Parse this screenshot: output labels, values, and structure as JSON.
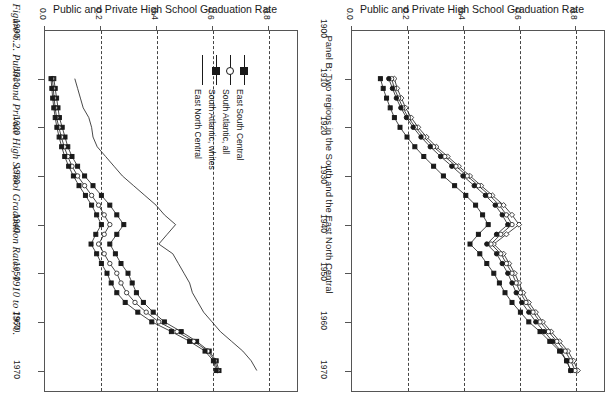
{
  "figure": {
    "caption": "Figure 6.2. Public and Private High School Graduation Rates, 1910 to 1970.",
    "panel_b_caption": "Panel B: Two regions in the South and the East North Central"
  },
  "panels": [
    {
      "id": "panel-left",
      "title": "Public and Private High School Graduation Rate",
      "value_axis": {
        "ticks": [
          "0.0",
          "0.2",
          "0.4",
          "0.6",
          "0.8"
        ],
        "min": 0.0,
        "max": 0.9
      },
      "year_axis": {
        "ticks": [
          "1900",
          "1910",
          "1920",
          "1930",
          "1940",
          "1950",
          "1960",
          "1970"
        ],
        "min": 1900,
        "max": 1974
      },
      "legend": [
        {
          "label": "East North Central",
          "marker": "line"
        },
        {
          "label": "South Atlantic, whites",
          "marker": "filled-square"
        },
        {
          "label": "South Atlantic, all",
          "marker": "open-circle"
        },
        {
          "label": "East South Central",
          "marker": "filled-square"
        }
      ]
    },
    {
      "id": "panel-right",
      "title": "Public and Private High School Graduation Rate",
      "value_axis": {
        "ticks": [
          "0.0",
          "0.2",
          "0.4",
          "0.6",
          "0.8"
        ],
        "min": 0.0,
        "max": 0.9
      },
      "year_axis": {
        "ticks": [
          "1900",
          "1910",
          "1920",
          "1930",
          "1940",
          "1950",
          "1960",
          "1970"
        ],
        "min": 1900,
        "max": 1974
      },
      "legend": [
        {
          "label": "Pacific",
          "marker": "line-dash"
        },
        {
          "label": "New England",
          "marker": "open-circle"
        },
        {
          "label": "West North Central",
          "marker": "filled-square"
        },
        {
          "label": "Middle Atlantic",
          "marker": "filled-square"
        }
      ]
    }
  ],
  "chart_data": [
    {
      "type": "line",
      "panel": "left",
      "title": "Public and Private High School Graduation Rate",
      "subtitle": "Figure 6.2. Public and Private High School Graduation Rates, 1910 to 1970.",
      "xlabel": "Year",
      "ylabel": "Public and Private High School Graduation Rate",
      "orientation": "rotated-90",
      "xlim": [
        1900,
        1974
      ],
      "ylim": [
        0.0,
        0.9
      ],
      "grid": "dashed vertical gridlines at 0.2, 0.4, 0.6, 0.8",
      "legend_position": "upper-right-inside",
      "x": [
        1910,
        1912,
        1914,
        1916,
        1918,
        1920,
        1922,
        1924,
        1926,
        1928,
        1930,
        1932,
        1934,
        1936,
        1938,
        1940,
        1942,
        1944,
        1946,
        1948,
        1950,
        1952,
        1954,
        1956,
        1958,
        1960,
        1962,
        1964,
        1966,
        1968,
        1970
      ],
      "series": [
        {
          "name": "East North Central",
          "marker": "line",
          "values": [
            0.11,
            0.12,
            0.13,
            0.14,
            0.16,
            0.17,
            0.175,
            0.19,
            0.22,
            0.25,
            0.28,
            0.32,
            0.36,
            0.4,
            0.43,
            0.47,
            0.44,
            0.41,
            0.46,
            0.48,
            0.5,
            0.52,
            0.53,
            0.55,
            0.57,
            0.6,
            0.63,
            0.67,
            0.71,
            0.74,
            0.76
          ]
        },
        {
          "name": "South Atlantic, whites",
          "marker": "filled-square",
          "values": [
            0.035,
            0.04,
            0.045,
            0.05,
            0.055,
            0.065,
            0.075,
            0.085,
            0.1,
            0.12,
            0.145,
            0.175,
            0.205,
            0.235,
            0.26,
            0.285,
            0.26,
            0.235,
            0.255,
            0.275,
            0.3,
            0.315,
            0.33,
            0.355,
            0.39,
            0.43,
            0.49,
            0.545,
            0.59,
            0.615,
            0.625
          ]
        },
        {
          "name": "South Atlantic, all",
          "marker": "open-circle",
          "values": [
            0.03,
            0.033,
            0.036,
            0.04,
            0.045,
            0.053,
            0.062,
            0.072,
            0.085,
            0.1,
            0.12,
            0.145,
            0.17,
            0.195,
            0.215,
            0.235,
            0.215,
            0.195,
            0.215,
            0.235,
            0.26,
            0.275,
            0.295,
            0.325,
            0.365,
            0.41,
            0.475,
            0.535,
            0.585,
            0.61,
            0.62
          ]
        },
        {
          "name": "East South Central",
          "marker": "filled-square",
          "values": [
            0.025,
            0.028,
            0.031,
            0.035,
            0.04,
            0.046,
            0.054,
            0.063,
            0.074,
            0.088,
            0.105,
            0.125,
            0.148,
            0.17,
            0.188,
            0.205,
            0.185,
            0.168,
            0.188,
            0.205,
            0.225,
            0.24,
            0.26,
            0.29,
            0.335,
            0.385,
            0.455,
            0.52,
            0.575,
            0.605,
            0.615
          ]
        }
      ]
    },
    {
      "type": "line",
      "panel": "right",
      "title": "Public and Private High School Graduation Rate",
      "subtitle": "Panel B: Two regions in the South and the East North Central",
      "xlabel": "Year",
      "ylabel": "Public and Private High School Graduation Rate",
      "orientation": "rotated-90",
      "xlim": [
        1900,
        1974
      ],
      "ylim": [
        0.0,
        0.9
      ],
      "grid": "dashed vertical gridlines at 0.2, 0.4, 0.6, 0.8",
      "legend_position": "upper-right-inside",
      "x": [
        1910,
        1912,
        1914,
        1916,
        1918,
        1920,
        1922,
        1924,
        1926,
        1928,
        1930,
        1932,
        1934,
        1936,
        1938,
        1940,
        1942,
        1944,
        1946,
        1948,
        1950,
        1952,
        1954,
        1956,
        1958,
        1960,
        1962,
        1964,
        1966,
        1968,
        1970
      ],
      "series": [
        {
          "name": "Pacific",
          "marker": "open-diamond",
          "values": [
            0.155,
            0.165,
            0.18,
            0.195,
            0.215,
            0.24,
            0.27,
            0.305,
            0.345,
            0.385,
            0.425,
            0.465,
            0.505,
            0.545,
            0.575,
            0.6,
            0.555,
            0.51,
            0.545,
            0.565,
            0.585,
            0.6,
            0.615,
            0.635,
            0.66,
            0.685,
            0.715,
            0.745,
            0.775,
            0.795,
            0.81
          ]
        },
        {
          "name": "New England",
          "marker": "open-circle",
          "values": [
            0.145,
            0.155,
            0.17,
            0.185,
            0.205,
            0.23,
            0.26,
            0.295,
            0.335,
            0.375,
            0.415,
            0.455,
            0.495,
            0.53,
            0.555,
            0.575,
            0.535,
            0.5,
            0.535,
            0.555,
            0.575,
            0.59,
            0.605,
            0.625,
            0.65,
            0.675,
            0.705,
            0.735,
            0.765,
            0.785,
            0.8
          ]
        },
        {
          "name": "West North Central",
          "marker": "filled-circle",
          "values": [
            0.135,
            0.148,
            0.162,
            0.178,
            0.198,
            0.222,
            0.25,
            0.283,
            0.32,
            0.36,
            0.4,
            0.44,
            0.48,
            0.515,
            0.54,
            0.56,
            0.52,
            0.485,
            0.52,
            0.54,
            0.56,
            0.575,
            0.59,
            0.61,
            0.635,
            0.66,
            0.69,
            0.72,
            0.75,
            0.77,
            0.785
          ]
        },
        {
          "name": "Middle Atlantic",
          "marker": "filled-square",
          "values": [
            0.105,
            0.115,
            0.127,
            0.14,
            0.155,
            0.175,
            0.2,
            0.228,
            0.26,
            0.295,
            0.33,
            0.37,
            0.41,
            0.445,
            0.47,
            0.49,
            0.455,
            0.425,
            0.46,
            0.485,
            0.51,
            0.53,
            0.55,
            0.575,
            0.605,
            0.635,
            0.675,
            0.71,
            0.745,
            0.77,
            0.785
          ]
        }
      ]
    }
  ]
}
